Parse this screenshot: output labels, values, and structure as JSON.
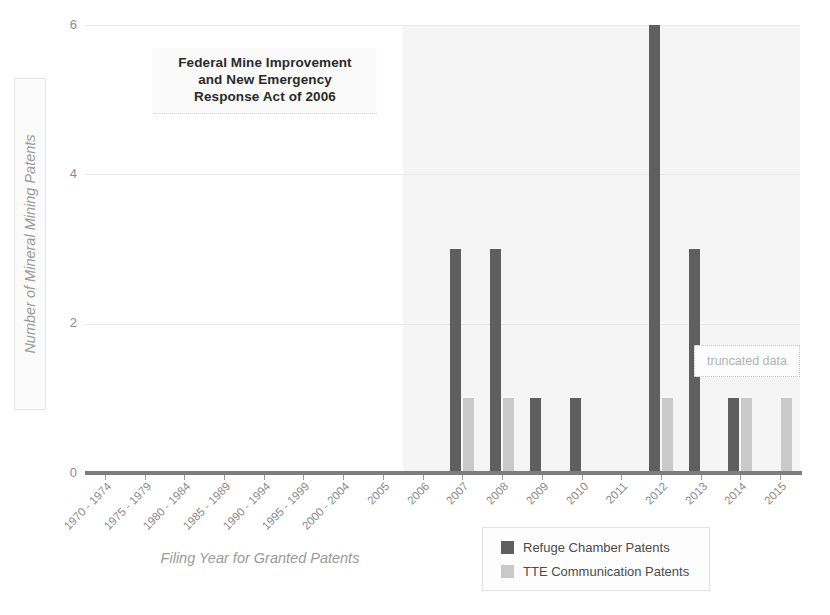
{
  "chart_data": {
    "type": "bar",
    "title": "",
    "xlabel": "Filing Year for Granted Patents",
    "ylabel": "Number of Mineral Mining Patents",
    "ylim": [
      0,
      6
    ],
    "yticks": [
      0,
      2,
      4,
      6
    ],
    "grid": true,
    "legend_position": "bottom-right",
    "categories": [
      "1970 - 1974",
      "1975 - 1979",
      "1980 - 1984",
      "1985 - 1989",
      "1990 - 1994",
      "1995 - 1999",
      "2000 - 2004",
      "2005",
      "2006",
      "2007",
      "2008",
      "2009",
      "2010",
      "2011",
      "2012",
      "2013",
      "2014",
      "2015"
    ],
    "series": [
      {
        "name": "Refuge Chamber Patents",
        "color": "#5f5f5f",
        "values": [
          0,
          0,
          0,
          0,
          0,
          0,
          0,
          0,
          0,
          3,
          3,
          1,
          1,
          0,
          6,
          3,
          1,
          0
        ]
      },
      {
        "name": "TTE Communication Patents",
        "color": "#c9c9c9",
        "values": [
          0,
          0,
          0,
          0,
          0,
          0,
          0,
          0,
          0,
          1,
          1,
          0,
          0,
          0,
          1,
          0,
          1,
          1
        ]
      }
    ],
    "annotations": [
      {
        "name": "act-title",
        "lines": [
          "Federal Mine Improvement",
          "and New Emergency",
          "Response Act of 2006"
        ]
      },
      {
        "name": "truncated-data",
        "text": "truncated data"
      }
    ],
    "shaded_region": {
      "label": "post-2006 period",
      "start_category": "2006",
      "color": "#f2f2f2"
    }
  },
  "legend": {
    "items": [
      {
        "label": "Refuge Chamber Patents",
        "color": "#5f5f5f"
      },
      {
        "label": "TTE Communication Patents",
        "color": "#c9c9c9"
      }
    ]
  }
}
